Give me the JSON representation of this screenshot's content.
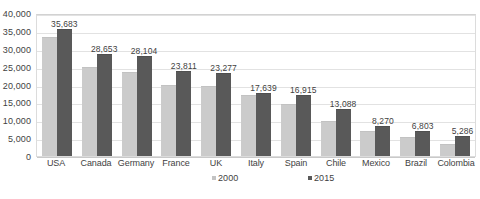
{
  "chart_data": {
    "type": "bar",
    "title": "",
    "subtitle": "",
    "xlabel": "",
    "ylabel": "",
    "ylim": [
      0,
      40000
    ],
    "ytick_step": 5000,
    "yticks": [
      "0",
      "5,000",
      "10,000",
      "15,000",
      "20,000",
      "25,000",
      "30,000",
      "35,000",
      "40,000"
    ],
    "ytick_values": [
      0,
      5000,
      10000,
      15000,
      20000,
      25000,
      30000,
      35000,
      40000
    ],
    "grid": "horizontal",
    "legend_position": "bottom",
    "categories": [
      "USA",
      "Canada",
      "Germany",
      "France",
      "UK",
      "Italy",
      "Spain",
      "Chile",
      "Mexico",
      "Brazil",
      "Colombia"
    ],
    "series": [
      {
        "name": "2000",
        "color": "#cbcbcb",
        "labels_shown": false,
        "values": [
          33400,
          24800,
          23600,
          19900,
          19400,
          17100,
          14400,
          9700,
          6900,
          5000,
          3100
        ],
        "value_labels": [
          "",
          "",
          "",
          "",
          "",
          "",
          "",
          "",
          "",
          "",
          ""
        ]
      },
      {
        "name": "2015",
        "color": "#595959",
        "labels_shown": true,
        "values": [
          35683,
          28653,
          28104,
          23811,
          23277,
          17639,
          16915,
          13088,
          8270,
          6803,
          5286
        ],
        "value_labels": [
          "35,683",
          "28,653",
          "28,104",
          "23,811",
          "23,277",
          "17,639",
          "16,915",
          "13,088",
          "8,270",
          "6,803",
          "5,286"
        ]
      }
    ]
  },
  "legend": {
    "entries": [
      {
        "label": "2000",
        "color": "#c3c3c3"
      },
      {
        "label": "2015",
        "color": "#595959"
      }
    ]
  },
  "colors": {
    "series_2000": "#cbcbcb",
    "series_2015": "#595959",
    "gridline": "#e2e2e2",
    "plot_border": "#dcdcdc",
    "text": "#3f3f3f",
    "background": "#ffffff"
  }
}
